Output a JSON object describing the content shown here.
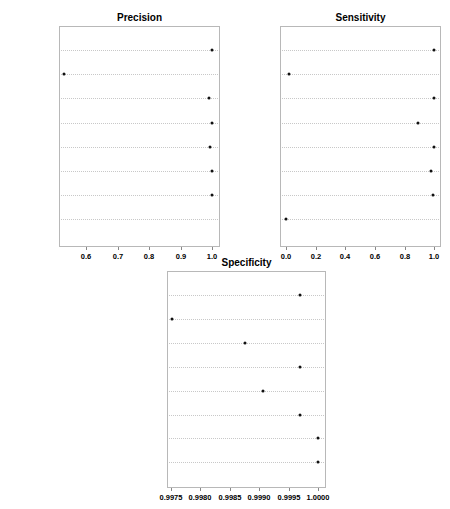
{
  "chart_data": [
    {
      "type": "scatter",
      "subtype": "dotplot",
      "title": "Precision",
      "xlabel": "",
      "ylabel": "",
      "categories": [
        "J48",
        "NB",
        "SVM",
        "rfRules",
        "AdaBoost.M1",
        "C5.0",
        "JRip",
        "NNet"
      ],
      "values": [
        1.0,
        0.53,
        0.99,
        1.0,
        0.995,
        1.0,
        1.0,
        null
      ],
      "xticks": [
        "0.6",
        "0.7",
        "0.8",
        "0.9",
        "1.0"
      ],
      "xlim": [
        0.515,
        1.02
      ],
      "grid": "horizontal dotted"
    },
    {
      "type": "scatter",
      "subtype": "dotplot",
      "title": "Sensitivity",
      "xlabel": "",
      "ylabel": "",
      "categories": [
        "J48",
        "NB",
        "SVM",
        "rfRules",
        "AdaBoost.M1",
        "C5.0",
        "JRip",
        "NNet"
      ],
      "values": [
        1.0,
        0.02,
        1.0,
        0.89,
        1.0,
        0.98,
        0.99,
        0.0
      ],
      "xticks": [
        "0.0",
        "0.2",
        "0.4",
        "0.6",
        "0.8",
        "1.0"
      ],
      "xlim": [
        -0.04,
        1.04
      ],
      "grid": "horizontal dotted"
    },
    {
      "type": "scatter",
      "subtype": "dotplot",
      "title": "Specificity",
      "xlabel": "",
      "ylabel": "",
      "categories": [
        "J48",
        "NB",
        "SVM",
        "rfRules",
        "AdaBoost.M1",
        "C5.0",
        "JRip",
        "NNet"
      ],
      "values": [
        0.99969,
        0.99752,
        0.99876,
        0.99969,
        0.99907,
        0.99969,
        1.0,
        1.0
      ],
      "xticks": [
        "0.9975",
        "0.9980",
        "0.9985",
        "0.9990",
        "0.9995",
        "1.0000"
      ],
      "xlim": [
        0.99743,
        1.00015
      ],
      "grid": "horizontal dotted"
    }
  ],
  "layout": [
    {
      "left": 59,
      "top": 26,
      "width": 161,
      "height": 221,
      "titleY": 12,
      "rowTop": 50,
      "rowStep": 24.2,
      "tickPx": [
        86,
        118,
        149,
        181,
        212
      ],
      "tickVals": [
        0.6,
        0.7,
        0.8,
        0.9,
        1.0
      ]
    },
    {
      "left": 280,
      "top": 26,
      "width": 161,
      "height": 221,
      "titleY": 12,
      "rowTop": 50,
      "rowStep": 24.2,
      "tickPx": [
        286,
        316,
        345,
        375,
        405,
        434
      ],
      "tickVals": [
        0.0,
        0.2,
        0.4,
        0.6,
        0.8,
        1.0
      ]
    },
    {
      "left": 167,
      "top": 271,
      "width": 159,
      "height": 217,
      "titleY": 257,
      "rowTop": 295,
      "rowStep": 23.9,
      "tickPx": [
        171,
        200,
        230,
        259,
        289,
        318
      ],
      "tickVals": [
        0.9975,
        0.998,
        0.9985,
        0.999,
        0.9995,
        1.0
      ]
    }
  ]
}
